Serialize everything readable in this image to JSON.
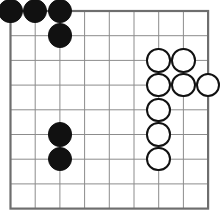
{
  "board": {
    "title": "Go board position",
    "game": "Go",
    "grid_lines": 9,
    "grid_cells": 8,
    "origin_x": 10.5,
    "origin_y": 11.0,
    "cell_size": 24.7,
    "stone_diameter": 24.5,
    "colors": {
      "background": "#ffffff",
      "grid_line": "#8c8c8c",
      "border_line": "#6e6e6e",
      "black_stone": "#111111",
      "white_stone": "#ffffff",
      "white_stone_outline": "#111111"
    },
    "border_width": 2.2,
    "line_width": 1.0,
    "stones": [
      {
        "color": "black",
        "col": 0,
        "row": 0,
        "label": "black-stone-a9"
      },
      {
        "color": "black",
        "col": 1,
        "row": 0,
        "label": "black-stone-b9"
      },
      {
        "color": "black",
        "col": 2,
        "row": 0,
        "label": "black-stone-c9"
      },
      {
        "color": "black",
        "col": 2,
        "row": 1,
        "label": "black-stone-c8"
      },
      {
        "color": "black",
        "col": 2,
        "row": 5,
        "label": "black-stone-c4"
      },
      {
        "color": "black",
        "col": 2,
        "row": 6,
        "label": "black-stone-c3"
      },
      {
        "color": "white",
        "col": 6,
        "row": 2,
        "label": "white-stone-g7"
      },
      {
        "color": "white",
        "col": 7,
        "row": 2,
        "label": "white-stone-h7"
      },
      {
        "color": "white",
        "col": 6,
        "row": 3,
        "label": "white-stone-g6"
      },
      {
        "color": "white",
        "col": 7,
        "row": 3,
        "label": "white-stone-h6"
      },
      {
        "color": "white",
        "col": 8,
        "row": 3,
        "label": "white-stone-j6"
      },
      {
        "color": "white",
        "col": 6,
        "row": 4,
        "label": "white-stone-g5"
      },
      {
        "color": "white",
        "col": 6,
        "row": 5,
        "label": "white-stone-g4"
      },
      {
        "color": "white",
        "col": 6,
        "row": 6,
        "label": "white-stone-g3"
      }
    ],
    "counts": {
      "black": 6,
      "white": 8,
      "total": 14
    }
  }
}
